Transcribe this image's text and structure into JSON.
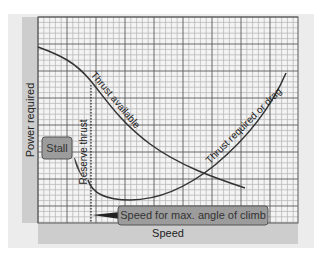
{
  "chart_data": {
    "type": "line",
    "title": "",
    "xlabel": "Speed",
    "ylabel": "Power required",
    "grid": true,
    "legend": "none (curves labeled inline)",
    "series": [
      {
        "name": "Thrust available",
        "points_px": [
          [
            38,
            47
          ],
          [
            60,
            56
          ],
          [
            80,
            70
          ],
          [
            100,
            95
          ],
          [
            120,
            120
          ],
          [
            140,
            138
          ],
          [
            160,
            151
          ],
          [
            180,
            163
          ],
          [
            210,
            176
          ],
          [
            245,
            188
          ]
        ]
      },
      {
        "name": "Thrust required or drag",
        "points_px": [
          [
            88,
            183
          ],
          [
            95,
            192
          ],
          [
            108,
            198
          ],
          [
            130,
            200
          ],
          [
            155,
            196
          ],
          [
            180,
            186
          ],
          [
            207,
            171
          ],
          [
            235,
            150
          ],
          [
            260,
            117
          ],
          [
            286,
            73
          ]
        ]
      }
    ],
    "annotations": [
      {
        "text": "Stall",
        "type": "callout"
      },
      {
        "text": "Reserve thrust",
        "type": "vertical-dotted-line"
      },
      {
        "text": "Speed for max. angle of climb",
        "type": "callout"
      }
    ],
    "xlim": "unlabeled",
    "ylim": "unlabeled"
  },
  "labels": {
    "y_axis": "Power required",
    "x_axis": "Speed",
    "thrust_available": "Thrust available",
    "thrust_required": "Thrust required or drag",
    "reserve_thrust": "Reserve thrust",
    "stall": "Stall",
    "max_climb": "Speed for max. angle of climb"
  },
  "colors": {
    "panel": "#ececec",
    "axis_bar": "#cdcdcd",
    "plot_bg": "#f4f4f4",
    "grid_minor": "#b9b9b9",
    "grid_major": "#5a5a5a",
    "curve": "#333333",
    "callout_fill": "#9c9c9c",
    "callout_stroke": "#555555"
  }
}
